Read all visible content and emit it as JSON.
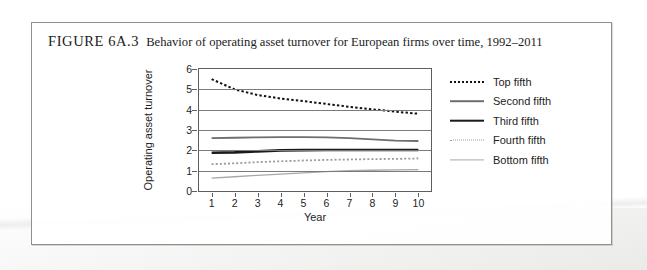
{
  "figure": {
    "label": "FIGURE 6A.3",
    "title": "Behavior of operating asset turnover for European firms over time, 1992–2011"
  },
  "chart_data": {
    "type": "line",
    "title": "",
    "xlabel": "Year",
    "ylabel": "Operating asset turnover",
    "x": [
      1,
      2,
      3,
      4,
      5,
      6,
      7,
      8,
      9,
      10
    ],
    "xtick_labels": [
      "1",
      "2",
      "3",
      "4",
      "5",
      "6",
      "7",
      "8",
      "9",
      "10"
    ],
    "ytick_labels": [
      "0",
      "1",
      "2",
      "3",
      "4",
      "5",
      "6"
    ],
    "xlim": [
      0.45,
      10.55
    ],
    "ylim": [
      0,
      6
    ],
    "grid": "horizontal",
    "legend_position": "right",
    "series": [
      {
        "name": "Top fifth",
        "style": "dotted",
        "color": "#111111",
        "width": 2.0,
        "values": [
          5.5,
          5.0,
          4.72,
          4.55,
          4.42,
          4.28,
          4.14,
          4.02,
          3.9,
          3.8
        ]
      },
      {
        "name": "Second fifth",
        "style": "solid",
        "color": "#6e6e6e",
        "width": 1.8,
        "values": [
          2.6,
          2.62,
          2.64,
          2.65,
          2.65,
          2.64,
          2.6,
          2.54,
          2.48,
          2.46
        ]
      },
      {
        "name": "Third fifth",
        "style": "solid",
        "color": "#1a1a1a",
        "width": 2.6,
        "values": [
          1.88,
          1.9,
          1.95,
          2.0,
          2.01,
          2.02,
          2.02,
          2.02,
          2.02,
          2.02
        ]
      },
      {
        "name": "Fourth fifth",
        "style": "dotted",
        "color": "#9a9a9a",
        "width": 1.8,
        "values": [
          1.32,
          1.36,
          1.42,
          1.46,
          1.5,
          1.53,
          1.55,
          1.57,
          1.58,
          1.6
        ]
      },
      {
        "name": "Bottom fifth",
        "style": "solid",
        "color": "#a8a8a8",
        "width": 1.3,
        "values": [
          0.63,
          0.7,
          0.77,
          0.83,
          0.89,
          0.95,
          1.0,
          1.02,
          1.04,
          1.05
        ]
      }
    ]
  }
}
